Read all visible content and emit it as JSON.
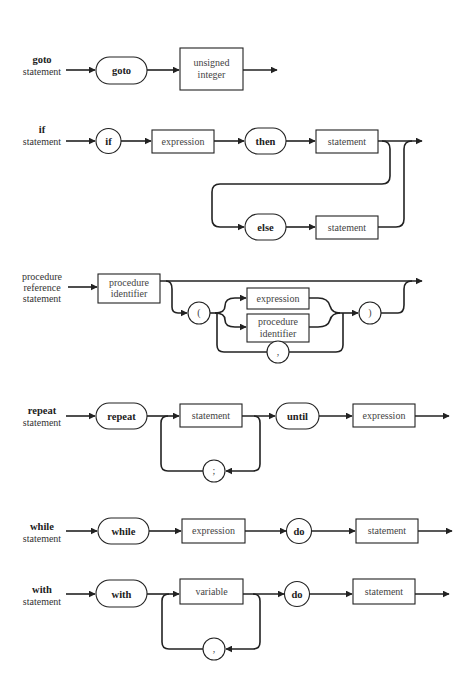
{
  "diagrams": {
    "goto": {
      "name_bold": "goto",
      "name_rest": "statement",
      "keyword": "goto",
      "box": [
        "unsigned",
        "integer"
      ]
    },
    "if": {
      "name_bold": "if",
      "name_rest": "statement",
      "kw_if": "if",
      "expression": "expression",
      "kw_then": "then",
      "statement1": "statement",
      "kw_else": "else",
      "statement2": "statement"
    },
    "procedure": {
      "name": [
        "procedure",
        "reference",
        "statement"
      ],
      "identifier": [
        "procedure",
        "identifier"
      ],
      "lparen": "(",
      "expression": "expression",
      "identifier2": [
        "procedure",
        "identifier"
      ],
      "comma": ",",
      "rparen": ")"
    },
    "repeat": {
      "name_bold": "repeat",
      "name_rest": "statement",
      "kw_repeat": "repeat",
      "statement": "statement",
      "semicolon": ";",
      "kw_until": "until",
      "expression": "expression"
    },
    "while": {
      "name_bold": "while",
      "name_rest": "statement",
      "kw_while": "while",
      "expression": "expression",
      "kw_do": "do",
      "statement": "statement"
    },
    "with": {
      "name_bold": "with",
      "name_rest": "statement",
      "kw_with": "with",
      "variable": "variable",
      "comma": ",",
      "kw_do": "do",
      "statement": "statement"
    }
  }
}
